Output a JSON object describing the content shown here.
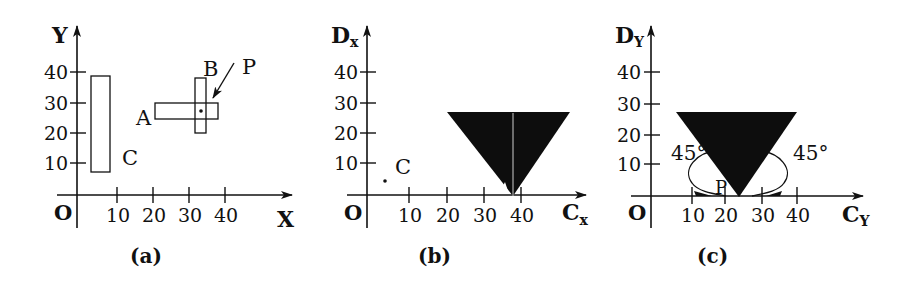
{
  "panels": [
    {
      "id": "a",
      "caption": "(a)",
      "x_axis_label": "X",
      "y_axis_label": "Y",
      "origin_label": "O",
      "x_ticks": [
        "10",
        "20",
        "30",
        "40"
      ],
      "y_ticks": [
        "10",
        "20",
        "30",
        "40"
      ],
      "objects": [
        {
          "label": "C",
          "type": "rectangle",
          "x_range": [
            2,
            8
          ],
          "y_range": [
            8,
            38
          ]
        },
        {
          "label": "A",
          "type": "rectangle",
          "x_range": [
            21,
            38
          ],
          "y_range": [
            25,
            29
          ]
        },
        {
          "label": "B",
          "type": "rectangle",
          "x_range": [
            32,
            35
          ],
          "y_range": [
            20,
            38
          ]
        },
        {
          "label": "P",
          "type": "point",
          "x": 33,
          "y": 27
        }
      ]
    },
    {
      "id": "b",
      "caption": "(b)",
      "x_axis_label": "C",
      "x_axis_subscript": "x",
      "y_axis_label": "D",
      "y_axis_subscript": "x",
      "origin_label": "O",
      "x_ticks": [
        "10",
        "20",
        "30",
        "40"
      ],
      "y_ticks": [
        "10",
        "20",
        "30",
        "40"
      ],
      "objects": [
        {
          "label": "C",
          "type": "point",
          "x": 5,
          "y": 5
        },
        {
          "type": "filled-triangle",
          "top_left": [
            21,
            27
          ],
          "top_right": [
            53,
            27
          ],
          "apex": [
            38,
            0
          ]
        }
      ]
    },
    {
      "id": "c",
      "caption": "(c)",
      "x_axis_label": "C",
      "x_axis_subscript": "Y",
      "y_axis_label": "D",
      "y_axis_subscript": "Y",
      "origin_label": "O",
      "x_ticks": [
        "10",
        "20",
        "30",
        "40"
      ],
      "y_ticks": [
        "10",
        "20",
        "30",
        "40"
      ],
      "angle_labels": [
        "45°",
        "45°"
      ],
      "point_label": "P",
      "objects": [
        {
          "type": "filled-triangle",
          "top_left": [
            7,
            27
          ],
          "top_right": [
            40,
            27
          ],
          "apex": [
            24,
            0
          ]
        }
      ]
    }
  ]
}
